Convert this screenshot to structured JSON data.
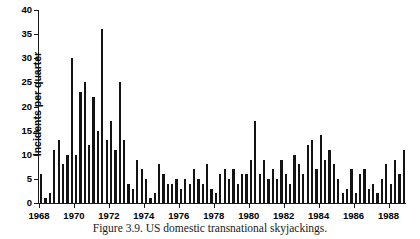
{
  "caption": "Figure 3.9.  US domestic transnational skyjackings.",
  "colors": {
    "bar": "#131313",
    "axis": "#1a1a1a",
    "background": "#ffffff",
    "text": "#000000"
  },
  "chart_data": {
    "type": "bar",
    "title": "",
    "subtitle": "",
    "xlabel": "",
    "ylabel": "Incidents per quarter",
    "ylim": [
      0,
      40
    ],
    "yticks": [
      0,
      5,
      10,
      15,
      20,
      25,
      30,
      35,
      40
    ],
    "ytick_labels": [
      "0",
      "5",
      "10",
      "15",
      "20",
      "25",
      "30",
      "35",
      "40"
    ],
    "xlim": [
      1968,
      1989
    ],
    "xticks": [
      1968,
      1970,
      1972,
      1974,
      1976,
      1978,
      1980,
      1982,
      1984,
      1986,
      1988
    ],
    "xtick_labels": [
      "1968",
      "1970",
      "1972",
      "1974",
      "1976",
      "1978",
      "1980",
      "1982",
      "1984",
      "1986",
      "1988"
    ],
    "grid": false,
    "legend": null,
    "annotations": [],
    "x_unit": "quarter",
    "categories": [
      "1968 Q1",
      "1968 Q2",
      "1968 Q3",
      "1968 Q4",
      "1969 Q1",
      "1969 Q2",
      "1969 Q3",
      "1969 Q4",
      "1970 Q1",
      "1970 Q2",
      "1970 Q3",
      "1970 Q4",
      "1971 Q1",
      "1971 Q2",
      "1971 Q3",
      "1971 Q4",
      "1972 Q1",
      "1972 Q2",
      "1972 Q3",
      "1972 Q4",
      "1973 Q1",
      "1973 Q2",
      "1973 Q3",
      "1973 Q4",
      "1974 Q1",
      "1974 Q2",
      "1974 Q3",
      "1974 Q4",
      "1975 Q1",
      "1975 Q2",
      "1975 Q3",
      "1975 Q4",
      "1976 Q1",
      "1976 Q2",
      "1976 Q3",
      "1976 Q4",
      "1977 Q1",
      "1977 Q2",
      "1977 Q3",
      "1977 Q4",
      "1978 Q1",
      "1978 Q2",
      "1978 Q3",
      "1978 Q4",
      "1979 Q1",
      "1979 Q2",
      "1979 Q3",
      "1979 Q4",
      "1980 Q1",
      "1980 Q2",
      "1980 Q3",
      "1980 Q4",
      "1981 Q1",
      "1981 Q2",
      "1981 Q3",
      "1981 Q4",
      "1982 Q1",
      "1982 Q2",
      "1982 Q3",
      "1982 Q4",
      "1983 Q1",
      "1983 Q2",
      "1983 Q3",
      "1983 Q4",
      "1984 Q1",
      "1984 Q2",
      "1984 Q3",
      "1984 Q4",
      "1985 Q1",
      "1985 Q2",
      "1985 Q3",
      "1985 Q4",
      "1986 Q1",
      "1986 Q2",
      "1986 Q3",
      "1986 Q4",
      "1987 Q1",
      "1987 Q2",
      "1987 Q3",
      "1987 Q4",
      "1988 Q1",
      "1988 Q2",
      "1988 Q3",
      "1988 Q4"
    ],
    "values": [
      6,
      1,
      2,
      11,
      13,
      8,
      10,
      30,
      10,
      23,
      25,
      12,
      22,
      15,
      36,
      13,
      17,
      11,
      25,
      13,
      4,
      3,
      9,
      7,
      5,
      1,
      2,
      8,
      6,
      4,
      4,
      5,
      3,
      5,
      4,
      7,
      5,
      4,
      8,
      3,
      2,
      6,
      7,
      5,
      7,
      4,
      6,
      6,
      9,
      17,
      6,
      9,
      5,
      7,
      5,
      9,
      6,
      4,
      10,
      8,
      6,
      12,
      13,
      7,
      14,
      9,
      11,
      8,
      5,
      2,
      3,
      7,
      2,
      6,
      7,
      3,
      4,
      2,
      5,
      8,
      4,
      9,
      6,
      11
    ]
  }
}
